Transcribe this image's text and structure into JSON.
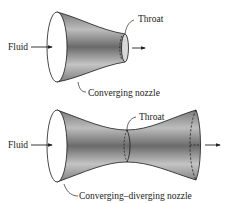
{
  "diagram": {
    "type": "nozzle-comparison",
    "colors": {
      "line": "#1a1a1a",
      "fill_dark": "#6e6e6e",
      "fill_light": "#e8e8e8",
      "background": "#ffffff"
    },
    "top": {
      "name": "Converging nozzle",
      "labels": {
        "inlet": "Fluid",
        "throat": "Throat",
        "caption": "Converging nozzle"
      }
    },
    "bottom": {
      "name": "Converging–diverging nozzle",
      "labels": {
        "inlet": "Fluid",
        "throat": "Throat",
        "caption": "Converging–diverging nozzle"
      }
    }
  }
}
